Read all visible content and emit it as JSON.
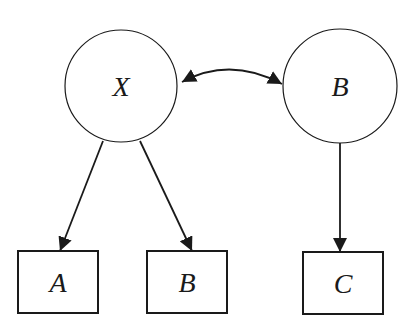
{
  "diagram": {
    "type": "path-diagram",
    "colors": {
      "stroke": "#1a1a1a",
      "background": "#ffffff"
    },
    "latent_nodes": [
      {
        "id": "X",
        "label": "X",
        "shape": "circle"
      },
      {
        "id": "B_latent",
        "label": "B",
        "shape": "circle"
      }
    ],
    "observed_nodes": [
      {
        "id": "A",
        "label": "A",
        "shape": "square"
      },
      {
        "id": "B_obs",
        "label": "B",
        "shape": "square"
      },
      {
        "id": "C",
        "label": "C",
        "shape": "square"
      }
    ],
    "edges": [
      {
        "from": "X",
        "to": "B_latent",
        "type": "bidirectional-curved"
      },
      {
        "from": "X",
        "to": "A",
        "type": "directed"
      },
      {
        "from": "X",
        "to": "B_obs",
        "type": "directed"
      },
      {
        "from": "B_latent",
        "to": "C",
        "type": "directed"
      }
    ]
  }
}
